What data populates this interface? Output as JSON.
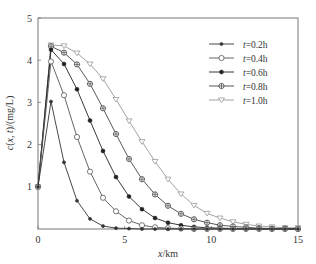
{
  "chart_data": {
    "type": "line",
    "title": "",
    "xlabel": "x/km",
    "ylabel": "c(x, t)/(mg/L)",
    "xlim": [
      0,
      15
    ],
    "ylim": [
      0,
      5
    ],
    "xticks": [
      0,
      5,
      10,
      15
    ],
    "yticks": [
      1,
      2,
      3,
      4,
      5
    ],
    "grid": false,
    "legend_position": "upper right",
    "x": [
      0,
      0.75,
      1.5,
      2.25,
      3,
      3.75,
      4.5,
      5.25,
      6,
      6.75,
      7.5,
      8.25,
      9,
      9.75,
      10.5,
      11.25,
      12,
      12.75,
      13.5,
      14.25,
      15
    ],
    "series": [
      {
        "name": "t=0.2h",
        "marker": "small-dot",
        "color": "#333333",
        "values": [
          1,
          3.02,
          1.58,
          0.67,
          0.24,
          0.07,
          0.02,
          0.01,
          0,
          0,
          0,
          0,
          0,
          0,
          0,
          0,
          0,
          0,
          0,
          0,
          0
        ]
      },
      {
        "name": "t=0.4h",
        "marker": "open-circle",
        "color": "#555555",
        "values": [
          1,
          3.97,
          3.17,
          2.18,
          1.36,
          0.74,
          0.42,
          0.2,
          0.09,
          0.04,
          0.02,
          0.01,
          0,
          0,
          0,
          0,
          0,
          0,
          0,
          0,
          0
        ]
      },
      {
        "name": "t=0.6h",
        "marker": "filled-dot",
        "color": "#222222",
        "values": [
          1,
          4.25,
          3.91,
          3.31,
          2.57,
          1.85,
          1.23,
          0.77,
          0.47,
          0.26,
          0.15,
          0.09,
          0.05,
          0.03,
          0.02,
          0.01,
          0,
          0,
          0,
          0,
          0
        ]
      },
      {
        "name": "t=0.8h",
        "marker": "circle-cross",
        "color": "#444444",
        "values": [
          1,
          4.33,
          4.18,
          3.9,
          3.44,
          2.86,
          2.25,
          1.66,
          1.18,
          0.82,
          0.55,
          0.36,
          0.23,
          0.15,
          0.09,
          0.06,
          0.04,
          0.02,
          0.01,
          0.01,
          0
        ]
      },
      {
        "name": "t=1.0h",
        "marker": "open-triangle-down",
        "color": "#999999",
        "values": [
          1,
          4.36,
          4.34,
          4.17,
          3.91,
          3.56,
          3.07,
          2.56,
          2.07,
          1.6,
          1.18,
          0.83,
          0.56,
          0.37,
          0.26,
          0.17,
          0.11,
          0.07,
          0.05,
          0.03,
          0.03
        ]
      }
    ]
  }
}
